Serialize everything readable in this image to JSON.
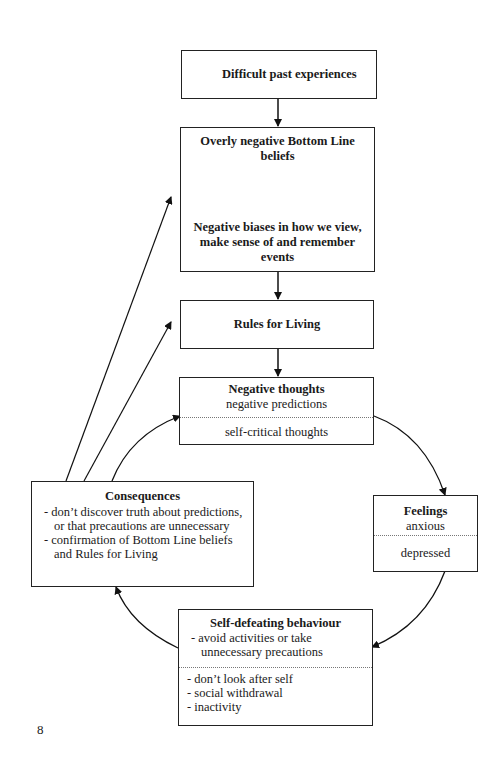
{
  "diagram": {
    "boxes": {
      "past": {
        "title": "Difficult past experiences"
      },
      "bottom_line": {
        "title": "Overly negative Bottom Line beliefs",
        "biases": "Negative biases in how we view, make sense of and remember events"
      },
      "rules": {
        "title": "Rules for Living"
      },
      "thoughts": {
        "title": "Negative thoughts",
        "line1": "negative predictions",
        "line2": "self-critical thoughts"
      },
      "feelings": {
        "title": "Feelings",
        "line1": "anxious",
        "line2": "depressed"
      },
      "behaviour": {
        "title": "Self-defeating behaviour",
        "items_top": [
          "- avoid activities or take unnecessary precautions"
        ],
        "items_bottom": [
          "- don’t look after self",
          "- social withdrawal",
          "- inactivity"
        ]
      },
      "consequences": {
        "title": "Consequences",
        "items": [
          "- don’t discover truth about predictions, or that precautions are unnecessary",
          "- confirmation of Bottom Line beliefs and Rules for Living"
        ]
      }
    },
    "page_number": "8"
  }
}
